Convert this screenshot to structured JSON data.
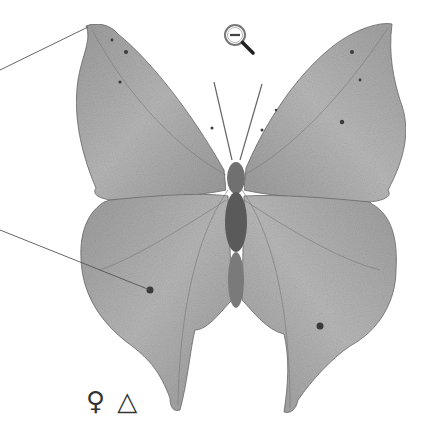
{
  "image": {
    "subject": "butterfly specimen illustration (dorsal view, wings spread, leaf-shaped wings)",
    "colors": {
      "background": "#ffffff",
      "wing_fill": "#a9a9a9",
      "wing_light": "#c4c4c4",
      "wing_dark": "#5a5a5a",
      "body": "#6e6e6e",
      "leader_line": "#555555"
    }
  },
  "controls": {
    "zoom_out_icon": "zoom-out-icon"
  },
  "labels": {
    "sex_symbol": "♀",
    "marker_symbol": "△"
  },
  "annotations": {
    "leader_lines": [
      {
        "from": [
          0,
          70
        ],
        "to": [
          88,
          27
        ]
      },
      {
        "from": [
          0,
          230
        ],
        "to": [
          150,
          290
        ]
      }
    ]
  }
}
